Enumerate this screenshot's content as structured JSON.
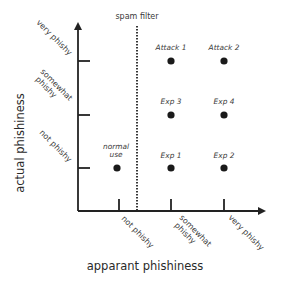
{
  "diagram": {
    "x_axis": {
      "title": "apparant phishiness",
      "ticks": [
        "not phishy",
        "somewhat phishy",
        "very phishy"
      ],
      "tick_lines": [
        [
          "not phishy"
        ],
        [
          "somewhat",
          "phishy"
        ],
        [
          "very phishy"
        ]
      ]
    },
    "y_axis": {
      "title": "actual phishiness",
      "ticks": [
        "not phishy",
        "somewhat phishy",
        "very phishy"
      ],
      "tick_lines": [
        [
          "not phishy"
        ],
        [
          "somewhat",
          "phishy"
        ],
        [
          "very phishy"
        ]
      ]
    },
    "threshold": {
      "label": "spam filter",
      "style": "dotted vertical line between 'not phishy' and 'somewhat phishy' apparent phishiness"
    },
    "points": [
      {
        "label_lines": [
          "normal",
          "use"
        ],
        "x": "not phishy",
        "y": "not phishy"
      },
      {
        "label_lines": [
          "Exp 1"
        ],
        "x": "somewhat phishy",
        "y": "not phishy"
      },
      {
        "label_lines": [
          "Exp 2"
        ],
        "x": "very phishy",
        "y": "not phishy"
      },
      {
        "label_lines": [
          "Exp 3"
        ],
        "x": "somewhat phishy",
        "y": "somewhat phishy"
      },
      {
        "label_lines": [
          "Exp 4"
        ],
        "x": "very phishy",
        "y": "somewhat phishy"
      },
      {
        "label_lines": [
          "Attack 1"
        ],
        "x": "somewhat phishy",
        "y": "very phishy"
      },
      {
        "label_lines": [
          "Attack 2"
        ],
        "x": "very phishy",
        "y": "very phishy"
      }
    ],
    "colors": {
      "axis": "#222222",
      "point": "#1a1a1a",
      "text": "#3a3a3a",
      "background": "#ffffff"
    }
  }
}
